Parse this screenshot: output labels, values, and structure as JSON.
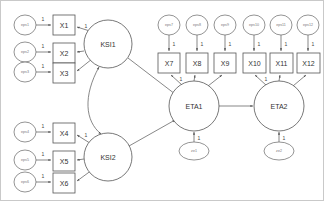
{
  "diagram": {
    "type": "sem-path-diagram",
    "background_color": "#ffffff",
    "border_color": "#c9c9c9",
    "line_color": "#555555",
    "text_color": "#333333"
  },
  "latent_variables": [
    {
      "id": "KSI1",
      "label": "KSI1",
      "cx": 107,
      "cy": 43,
      "r": 24,
      "kind": "exogenous"
    },
    {
      "id": "KSI2",
      "label": "KSI2",
      "cx": 107,
      "cy": 156,
      "r": 24,
      "kind": "exogenous"
    },
    {
      "id": "ETA1",
      "label": "ETA1",
      "cx": 193,
      "cy": 105,
      "r": 25,
      "kind": "endogenous"
    },
    {
      "id": "ETA2",
      "label": "ETA2",
      "cx": 278,
      "cy": 105,
      "r": 25,
      "kind": "endogenous"
    }
  ],
  "indicators": [
    {
      "id": "X1",
      "label": "X1",
      "x": 52,
      "y": 14,
      "w": 22,
      "h": 20,
      "parent": "KSI1",
      "loading": "1"
    },
    {
      "id": "X2",
      "label": "X2",
      "x": 52,
      "y": 42,
      "w": 22,
      "h": 20,
      "parent": "KSI1",
      "loading": ""
    },
    {
      "id": "X3",
      "label": "X3",
      "x": 52,
      "y": 62,
      "w": 22,
      "h": 20,
      "parent": "KSI1",
      "loading": ""
    },
    {
      "id": "X4",
      "label": "X4",
      "x": 52,
      "y": 122,
      "w": 22,
      "h": 20,
      "parent": "KSI2",
      "loading": "1"
    },
    {
      "id": "X5",
      "label": "X5",
      "x": 52,
      "y": 150,
      "w": 22,
      "h": 20,
      "parent": "KSI2",
      "loading": ""
    },
    {
      "id": "X6",
      "label": "X6",
      "x": 52,
      "y": 172,
      "w": 22,
      "h": 20,
      "parent": "KSI2",
      "loading": ""
    },
    {
      "id": "X7",
      "label": "X7",
      "x": 157,
      "y": 52,
      "w": 22,
      "h": 20,
      "parent": "ETA1",
      "loading": "1"
    },
    {
      "id": "X8",
      "label": "X8",
      "x": 185,
      "y": 52,
      "w": 22,
      "h": 20,
      "parent": "ETA1",
      "loading": ""
    },
    {
      "id": "X9",
      "label": "X9",
      "x": 213,
      "y": 52,
      "w": 22,
      "h": 20,
      "parent": "ETA1",
      "loading": ""
    },
    {
      "id": "X10",
      "label": "X10",
      "x": 242,
      "y": 52,
      "w": 23,
      "h": 20,
      "parent": "ETA2",
      "loading": "1"
    },
    {
      "id": "X11",
      "label": "X11",
      "x": 269,
      "y": 52,
      "w": 23,
      "h": 20,
      "parent": "ETA2",
      "loading": ""
    },
    {
      "id": "X12",
      "label": "X12",
      "x": 296,
      "y": 52,
      "w": 23,
      "h": 20,
      "parent": "ETA2",
      "loading": ""
    }
  ],
  "measurement_errors": [
    {
      "id": "e1",
      "label": "eps1",
      "cx": 24,
      "cy": 24,
      "rx": 11,
      "ry": 10,
      "target": "X1",
      "coef": "1"
    },
    {
      "id": "e2",
      "label": "eps2",
      "cx": 24,
      "cy": 51,
      "rx": 11,
      "ry": 10,
      "target": "X2",
      "coef": "1"
    },
    {
      "id": "e3",
      "label": "eps3",
      "cx": 24,
      "cy": 71,
      "rx": 11,
      "ry": 10,
      "target": "X3",
      "coef": "1"
    },
    {
      "id": "e4",
      "label": "eps4",
      "cx": 24,
      "cy": 131,
      "rx": 11,
      "ry": 10,
      "target": "X4",
      "coef": "1"
    },
    {
      "id": "e5",
      "label": "eps5",
      "cx": 24,
      "cy": 159,
      "rx": 11,
      "ry": 10,
      "target": "X5",
      "coef": "1"
    },
    {
      "id": "e6",
      "label": "eps6",
      "cx": 24,
      "cy": 181,
      "rx": 11,
      "ry": 10,
      "target": "X6",
      "coef": "1"
    },
    {
      "id": "e7",
      "label": "eps7",
      "cx": 168,
      "cy": 24,
      "rx": 11,
      "ry": 10,
      "target": "X7",
      "coef": "1"
    },
    {
      "id": "e8",
      "label": "eps8",
      "cx": 196,
      "cy": 24,
      "rx": 11,
      "ry": 10,
      "target": "X8",
      "coef": "1"
    },
    {
      "id": "e9",
      "label": "eps9",
      "cx": 224,
      "cy": 24,
      "rx": 11,
      "ry": 10,
      "target": "X9",
      "coef": "1"
    },
    {
      "id": "e10",
      "label": "eps10",
      "cx": 253,
      "cy": 24,
      "rx": 11,
      "ry": 10,
      "target": "X10",
      "coef": "1"
    },
    {
      "id": "e11",
      "label": "eps11",
      "cx": 280,
      "cy": 24,
      "rx": 11,
      "ry": 10,
      "target": "X11",
      "coef": "1"
    },
    {
      "id": "e12",
      "label": "eps12",
      "cx": 307,
      "cy": 24,
      "rx": 11,
      "ry": 10,
      "target": "X12",
      "coef": "1"
    }
  ],
  "disturbances": [
    {
      "id": "z1",
      "label": "ze1",
      "cx": 193,
      "cy": 150,
      "rx": 15,
      "ry": 9,
      "target": "ETA1",
      "coef": "1"
    },
    {
      "id": "z2",
      "label": "ze2",
      "cx": 278,
      "cy": 150,
      "rx": 15,
      "ry": 9,
      "target": "ETA2",
      "coef": "1"
    }
  ],
  "structural_paths": [
    {
      "from": "KSI1",
      "to": "ETA1",
      "label": ""
    },
    {
      "from": "KSI2",
      "to": "ETA1",
      "label": ""
    },
    {
      "from": "ETA1",
      "to": "ETA2",
      "label": ""
    }
  ],
  "covariances": [
    {
      "between": [
        "KSI1",
        "KSI2"
      ],
      "style": "double-headed-curve",
      "label": ""
    }
  ]
}
